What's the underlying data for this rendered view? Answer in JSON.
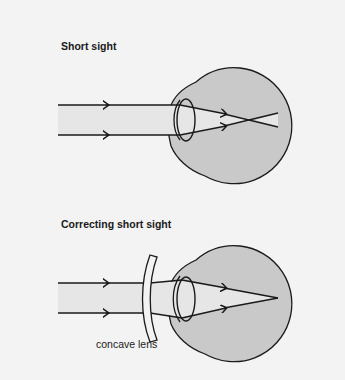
{
  "panels": [
    {
      "title": "Short sight",
      "description": "Parallel light rays enter the eye and focus in front of the retina, then diverge before reaching it."
    },
    {
      "title": "Correcting short sight",
      "description": "A concave lens diverges the incoming rays so the eye focuses them on the retina.",
      "lens_label": "concave lens"
    }
  ],
  "colors": {
    "background": "#f3f3f3",
    "eye_fill": "#c9c9c9",
    "beam_fill": "#e6e6e6",
    "stroke": "#1a1a1a"
  }
}
